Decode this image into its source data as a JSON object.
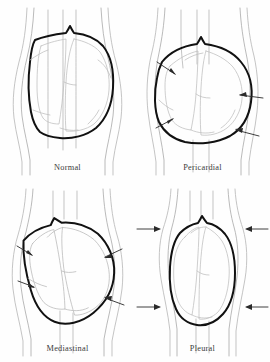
{
  "figure": {
    "background_color": "#fefefe",
    "line_colors": {
      "outline_heavy": "#111111",
      "outline_thin": "#b9b9b9",
      "chamber": "#bdbdbd",
      "arrow": "#2a2a2a",
      "label_text": "#3a3a3a"
    },
    "grid": {
      "rows": 2,
      "columns": 2
    }
  },
  "panels": [
    {
      "id": "normal",
      "label": "Normal",
      "position": "top-left",
      "arrow_count": 0,
      "arrow_directions": [],
      "description": "Normal cardiac silhouette with narrow mediastinum and visible vascular pedicle"
    },
    {
      "id": "pericardial",
      "label": "Pericardial",
      "position": "top-right",
      "arrow_count": 4,
      "arrow_directions": [
        "upper-left-inward",
        "lower-left-inward",
        "upper-right-inward",
        "lower-right-inward"
      ],
      "description": "Globular water-bottle shaped widening from pericardial effusion"
    },
    {
      "id": "mediastinal",
      "label": "Mediastinal",
      "position": "bottom-left",
      "arrow_count": 4,
      "arrow_directions": [
        "upper-left-inward",
        "lower-left-inward",
        "upper-right-inward",
        "lower-right-inward"
      ],
      "description": "Obliquely tilted widened mediastinal contour"
    },
    {
      "id": "pleural",
      "label": "Pleural",
      "position": "bottom-right",
      "arrow_count": 4,
      "arrow_directions": [
        "upper-left-horizontal",
        "lower-left-horizontal",
        "upper-right-horizontal",
        "lower-right-horizontal"
      ],
      "description": "Narrow compressed silhouette from bilateral pleural collections"
    }
  ]
}
